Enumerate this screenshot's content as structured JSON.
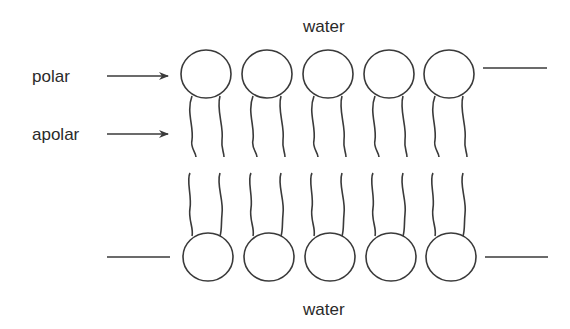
{
  "labels": {
    "water_top": "water",
    "water_bottom": "water",
    "polar": "polar",
    "apolar": "apolar"
  },
  "bilayer": {
    "lipid_count_per_leaflet": 5,
    "head_centers_x": [
      206,
      267,
      328,
      389,
      449
    ],
    "top_head_y": 74,
    "bottom_head_y": 257,
    "head_radius": 25
  },
  "colors": {
    "ink": "#3a3a3a",
    "background": "#ffffff"
  }
}
